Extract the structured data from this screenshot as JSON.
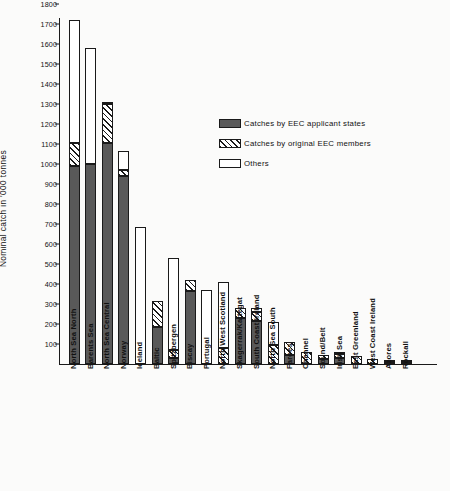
{
  "chart_data": {
    "type": "bar",
    "title": "",
    "subtitle": "",
    "xlabel": "",
    "ylabel": "Nominal catch in '000 tonnes",
    "ylim": [
      0,
      1850
    ],
    "yticks": [
      100,
      200,
      300,
      400,
      500,
      600,
      700,
      800,
      900,
      1000,
      1100,
      1200,
      1300,
      1400,
      1500,
      1600,
      1700,
      1800
    ],
    "ytick_labels": [
      "100",
      "200",
      "300",
      "400",
      "500",
      "600",
      "700",
      "800",
      "900",
      "1000",
      "1100",
      "1200",
      "1300",
      "1400",
      "1500",
      "1600",
      "1700",
      "1800"
    ],
    "grid": false,
    "stacked": true,
    "legend_position": "upper-right-inside",
    "categories": [
      "North Sea North",
      "Barents Sea",
      "North Sea Central",
      "Norway",
      "Iceland",
      "Baltic",
      "Spitzbergen",
      "Biscay",
      "Portugal",
      "North West Scotland",
      "Skagerrak/Kattegat",
      "South Coast Ireland",
      "North Sea South",
      "Faroes",
      "Channel",
      "Sound/Belt",
      "Irish Sea",
      "East Greenland",
      "West Coast Ireland",
      "Azores",
      "Rockall"
    ],
    "series": [
      {
        "name": "Catches by EEC applicant states",
        "fill": "solid-dark",
        "color": "#595959",
        "values": [
          990,
          1000,
          1105,
          940,
          0,
          185,
          30,
          365,
          0,
          0,
          230,
          215,
          0,
          45,
          0,
          25,
          30,
          0,
          0,
          0,
          0
        ]
      },
      {
        "name": "Catches by original EEC members",
        "fill": "diagonal-hatch",
        "color": "#ffffff",
        "values": [
          115,
          0,
          195,
          30,
          0,
          130,
          40,
          55,
          0,
          80,
          50,
          45,
          95,
          65,
          60,
          20,
          20,
          40,
          25,
          8,
          8
        ]
      },
      {
        "name": "Others",
        "fill": "white",
        "color": "#ffffff",
        "values": [
          615,
          580,
          5,
          95,
          685,
          0,
          460,
          0,
          370,
          330,
          0,
          20,
          115,
          0,
          0,
          0,
          10,
          0,
          0,
          4,
          4
        ]
      }
    ],
    "totals": [
      1720,
      1580,
      1305,
      1065,
      685,
      315,
      530,
      420,
      370,
      410,
      280,
      280,
      210,
      110,
      60,
      45,
      60,
      40,
      25,
      12,
      12
    ]
  },
  "legend": {
    "items": [
      {
        "label": "Catches by EEC applicant states",
        "swatch": "applicant"
      },
      {
        "label": "Catches by original EEC members",
        "swatch": "original"
      },
      {
        "label": "Others",
        "swatch": "others"
      }
    ]
  }
}
